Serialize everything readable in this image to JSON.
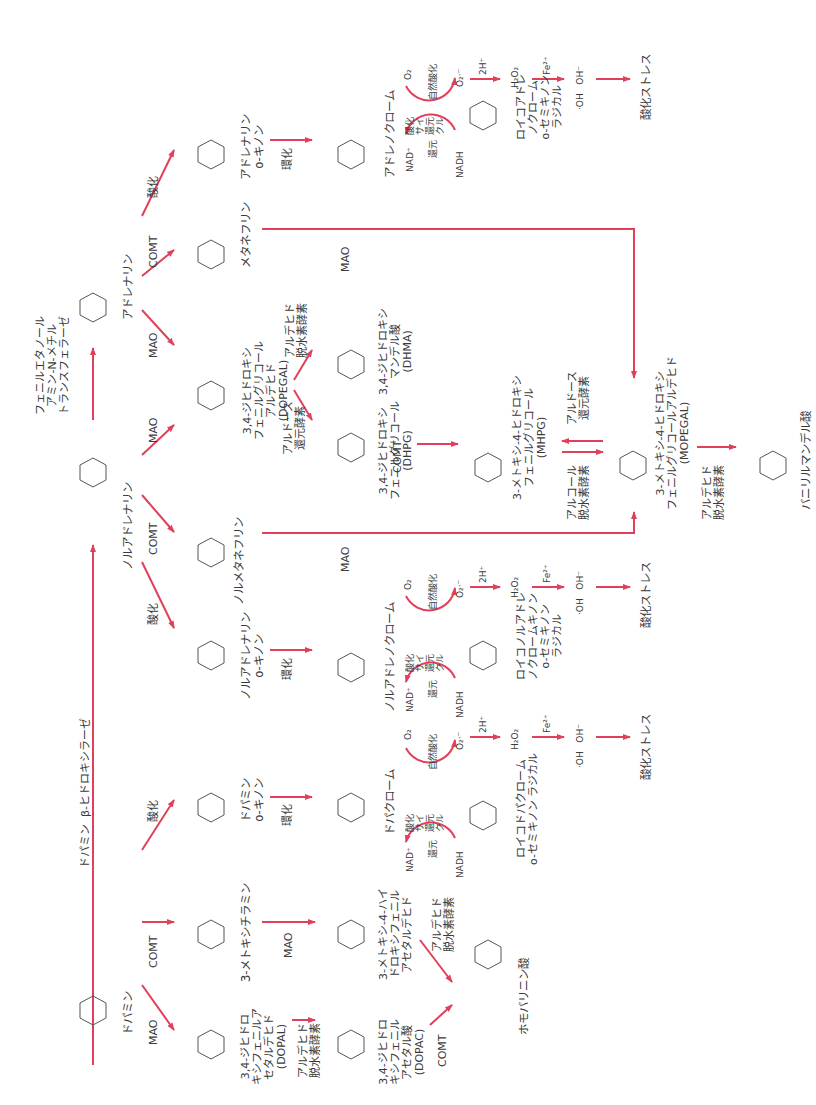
{
  "diagram": {
    "orientation": "rotated-90-ccw",
    "arrow_color": "#e0405a",
    "text_color": "#3a3a3a"
  },
  "compounds": {
    "dopamine": "ドパミン",
    "noradrenaline": "ノルアドレナリン",
    "adrenaline": "アドレナリン",
    "metanephrine": "メタネフリン",
    "normetanephrine": "ノルメタネフリン",
    "methoxytyramine": "3-メトキシチラミン",
    "adrenaline_quinone": "アドレナリン\no-キノン",
    "noradrenaline_quinone": "ノルアドレナリン\no-キノン",
    "dopamine_quinone": "ドパミン\no-キノン",
    "adrenochrome": "アドレノクローム",
    "noradrenochrome": "ノルアドレノクローム",
    "dopachrome": "ドパクローム",
    "leucoadrenochrome": "ロイコアドレ\nノクローム\no-セミキノン\nラジカル",
    "leuconoradrenochrome": "ロイコノルアドレ\nノクロームキノン\no-セミキノン\nラジカル",
    "leucodopachrome": "ロイコドパクローム\no-セミキノン ラジカル",
    "dopegal": "3,4-ジヒドロキシ\nフェニルグリコール\nアルデヒド\n(DOPEGAL)",
    "dhma": "3,4-ジヒドロキシ\nマンデル酸\n(DHMA)",
    "dhpg": "3,4-ジヒドロキシ\nフェニルグリコール\n(DHPG)",
    "mhpg": "3-メトキシ-4-ヒドロキシ\nフェニルグリコール\n(MHPG)",
    "mopegal": "3-メトキシ-4-ヒドロキシ\nフェニルグリコールアルデヒド\n(MOPEGAL)",
    "vma": "バニリルマンデル酸",
    "dopal": "3,4-ジヒドロ\nキシフェニルア\nセタルデヒド\n(DOPAL)",
    "dopac": "3,4-ジヒドロ\nキシフェニル\nアセタル酸\n(DOPAC)",
    "mhpa": "3-メトキシ-4-ハイ\nドロキシフェニル\nアセタルデヒド",
    "hva": "ホモバリニン酸"
  },
  "enzymes": {
    "dbh": "ドパミン  β-ヒドロキシラーゼ",
    "pnmt": "フェニルエタノール\nアミン-N-メチル\nトランスフェラーゼ",
    "mao": "MAO",
    "comt": "COMT",
    "oxidation": "酸化",
    "cyclization": "環化",
    "aldehyde_dh": "アルデヒド\n脱水素酵素",
    "aldose_reductase": "アルドース\n還元酵素",
    "alcohol_dh": "アルコール\n脱水素酵素"
  },
  "redox_cycle": {
    "nad": "NAD⁺",
    "nadh": "NADH",
    "reduction": "還元",
    "redox_cycle_label": "酸化\nサイ\n還元\nクル",
    "o2": "O₂",
    "auto_oxidation": "自然酸化",
    "superoxide": "O₂·⁻",
    "two_h": "2H⁺",
    "h2o2": "H₂O₂",
    "fe2": "Fe²⁺",
    "hydroxyl": "·OH   OH⁻",
    "oxidative_stress": "酸化ストレス"
  }
}
